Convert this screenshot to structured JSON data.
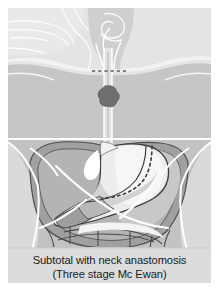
{
  "figure": {
    "name": "esophagectomy-diagram",
    "caption": {
      "line1": "Subtotal with neck anastomosis",
      "line2": "(Three stage Mc Ewan)"
    },
    "anatomy": {
      "head_label": "head-and-neck-silhouette",
      "torso_label": "torso-silhouette",
      "esophagus_label": "esophagus",
      "tumor_label": "esophageal-tumour",
      "stomach_label": "stomach",
      "liver_label": "liver",
      "intestines_label": "intestines",
      "diaphragm_label": "diaphragm-line",
      "neck_anastomosis_label": "neck-anastomosis-dashed-line",
      "gastric_resection_label": "gastric-resection-dashed-line"
    },
    "colors": {
      "page_background": "#ffffff",
      "body_light": "#d8d8d8",
      "body_mid": "#c2c2c2",
      "body_head": "#e3e3e3",
      "organ_dark": "#9a9a9a",
      "organ_mid": "#b0b0b0",
      "organ_light": "#d6d6d6",
      "stomach_fill": "#e9e9e9",
      "stomach_lumen": "#f7f7f7",
      "tumour": "#6e6e6e",
      "outline": "#4a4a4a",
      "highlight": "#ffffff",
      "caption_band": "#dcdcdc",
      "caption_text": "#1b1b1b"
    }
  }
}
